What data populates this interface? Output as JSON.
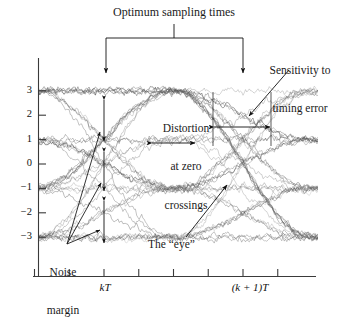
{
  "figure": {
    "type": "eye-diagram"
  },
  "chart_data": {
    "type": "line",
    "title": "",
    "xlabel": "",
    "ylabel": "",
    "xlim": [
      -0.6,
      1.6
    ],
    "ylim": [
      -3.8,
      3.8
    ],
    "grid": false,
    "legend": false,
    "x_ticks": [
      -0.5,
      -0.25,
      0.0,
      0.25,
      0.5,
      0.75,
      1.0,
      1.25
    ],
    "x_tick_labels": [
      "",
      "",
      "kT",
      "",
      "",
      "",
      "(k + 1)T",
      ""
    ],
    "y_ticks": [
      3,
      2,
      1,
      0,
      -1,
      -2,
      -3
    ],
    "y_tick_labels": [
      "3",
      "2",
      "1",
      "0",
      "−1",
      "−2",
      "−3"
    ],
    "levels": [
      3,
      1,
      -1,
      -3
    ],
    "symbol_period": 1.0,
    "traces_count": 40,
    "noise_amplitude": 0.28,
    "series": [
      {
        "name": "eye-trace-bundle",
        "color": "#5f5f5f",
        "levels": [
          3,
          1,
          -1,
          -3
        ],
        "description": "overlaid raised-cosine symbol transitions"
      }
    ],
    "annotations": [
      {
        "name": "optimum-sampling-times",
        "text": "Optimum sampling times",
        "x_targets": [
          0.0,
          1.0
        ],
        "style": "bracket-with-arrows"
      },
      {
        "name": "sensitivity-to-timing-error",
        "text": "Sensitivity to\ntiming error",
        "x": 1.0,
        "style": "leader-arrow"
      },
      {
        "name": "distortion-at-zero-crossings",
        "text": "Distortion\nat zero\ncrossings",
        "x": 0.5,
        "style": "double-arrow"
      },
      {
        "name": "noise-margin",
        "text": "Noise\nmargin",
        "x": 0.0,
        "style": "leader-arrows-triple"
      },
      {
        "name": "the-eye",
        "text": "The \"eye\"",
        "x": 1.0,
        "style": "leader-arrow"
      }
    ]
  },
  "labels": {
    "optimum_sampling_times": "Optimum sampling times",
    "sensitivity_line1": "Sensitivity to",
    "sensitivity_line2": "timing error",
    "distortion_line1": "Distortion",
    "distortion_line2": "at zero",
    "distortion_line3": "crossings",
    "noise_line1": "Noise",
    "noise_line2": "margin",
    "the_eye": "The “eye”"
  },
  "axis": {
    "y_labels": [
      "3",
      "2",
      "1",
      "0",
      "−1",
      "−2",
      "−3"
    ],
    "x_label_left": "kT",
    "x_label_right": "(k + 1)T"
  },
  "colors": {
    "trace": "#5f5f5f",
    "trace_dark": "#3d3d3d",
    "axis": "#3a3a3a",
    "annotation": "#111111",
    "background": "#ffffff"
  }
}
